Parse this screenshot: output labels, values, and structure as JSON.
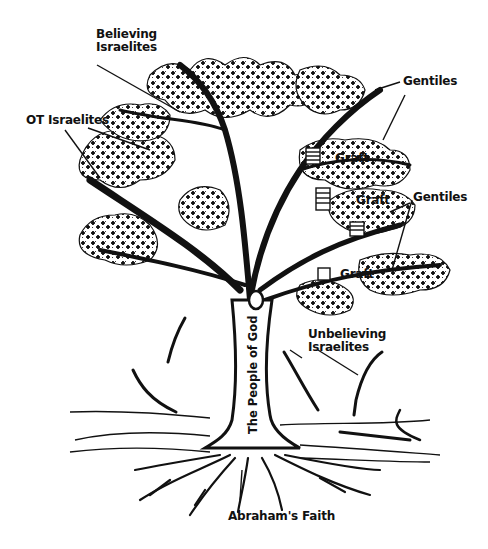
{
  "diagram": {
    "colors": {
      "ink": "#111111",
      "paper": "#ffffff"
    },
    "labels": {
      "believing_israelites": "Believing\nIsraelites",
      "ot_israelites": "OT Israelites",
      "gentiles_top": "Gentiles",
      "gentiles_middle": "Gentiles",
      "graft_1": "Graft",
      "graft_2": "Graft",
      "graft_3": "Graft",
      "unbelieving_israelites": "Unbelieving\nIsraelites",
      "trunk": "The People of God",
      "roots": "Abraham's Faith"
    }
  }
}
